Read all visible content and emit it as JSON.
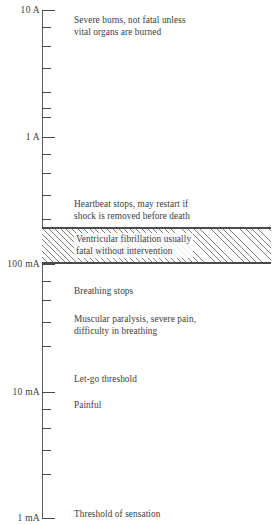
{
  "chart_data": {
    "type": "line",
    "orientation": "vertical-log-axis",
    "xlabel": "",
    "ylabel": "Current",
    "scale": "logarithmic",
    "ylim": [
      "1 mA",
      "10 A"
    ],
    "grid": false,
    "legend": "none",
    "axis_ticks": [
      {
        "label": "10 A",
        "value_amps": 10,
        "y": 10,
        "type": "major"
      },
      {
        "label": "",
        "value_amps": 9,
        "y": 27,
        "type": "minor"
      },
      {
        "label": "",
        "value_amps": 8,
        "y": 46,
        "type": "minor"
      },
      {
        "label": "",
        "value_amps": 7,
        "y": 68,
        "type": "minor"
      },
      {
        "label": "",
        "value_amps": 6,
        "y": 92,
        "type": "minor"
      },
      {
        "label": "",
        "value_amps": 5,
        "y": 108,
        "type": "minor"
      },
      {
        "label": "",
        "value_amps": 4,
        "y": 117,
        "type": "minor"
      },
      {
        "label": "1 A",
        "value_amps": 1,
        "y": 137,
        "type": "major"
      },
      {
        "label": "",
        "value_amps": 0.9,
        "y": 154,
        "type": "minor"
      },
      {
        "label": "",
        "value_amps": 0.8,
        "y": 173,
        "type": "minor"
      },
      {
        "label": "",
        "value_amps": 0.7,
        "y": 195,
        "type": "minor"
      },
      {
        "label": "",
        "value_amps": 0.5,
        "y": 219,
        "type": "minor"
      },
      {
        "label": "100 mA",
        "value_amps": 0.1,
        "y": 264,
        "type": "major"
      },
      {
        "label": "",
        "value_amps": 0.09,
        "y": 281,
        "type": "minor"
      },
      {
        "label": "",
        "value_amps": 0.08,
        "y": 300,
        "type": "minor"
      },
      {
        "label": "",
        "value_amps": 0.07,
        "y": 322,
        "type": "minor"
      },
      {
        "label": "",
        "value_amps": 0.05,
        "y": 346,
        "type": "minor"
      },
      {
        "label": "10 mA",
        "value_amps": 0.01,
        "y": 392,
        "type": "major"
      },
      {
        "label": "",
        "value_amps": 0.009,
        "y": 409,
        "type": "minor"
      },
      {
        "label": "",
        "value_amps": 0.008,
        "y": 428,
        "type": "minor"
      },
      {
        "label": "",
        "value_amps": 0.007,
        "y": 450,
        "type": "minor"
      },
      {
        "label": "",
        "value_amps": 0.005,
        "y": 474,
        "type": "minor"
      },
      {
        "label": "1 mA",
        "value_amps": 0.001,
        "y": 518,
        "type": "major"
      }
    ],
    "annotations": [
      {
        "text": "Severe burns, not fatal unless\nvital organs are burned",
        "y": 14
      },
      {
        "text": "Heartbeat stops, may restart if\nshock is removed before death",
        "y": 198
      },
      {
        "text": "Ventricular fibrillation usually\nfatal without intervention",
        "y": 232,
        "in_band": true
      },
      {
        "text": "Breathing stops",
        "y": 285
      },
      {
        "text": "Muscular paralysis, severe pain,\ndifficulty in breathing",
        "y": 313
      },
      {
        "text": "Let-go threshold",
        "y": 373
      },
      {
        "text": "Painful",
        "y": 399
      },
      {
        "text": "Threshold of sensation",
        "y": 508
      }
    ],
    "band": {
      "label": "Ventricular fibrillation usually\nfatal without intervention",
      "top_y": 227,
      "bottom_y": 264,
      "hatched": true,
      "hatch_color": "#7d7d7d",
      "border_color": "#4a4a4a"
    },
    "colors": {
      "axis": "#5a5a5a",
      "text": "#3d3d3d",
      "background": "#ffffff",
      "hatch": "#7d7d7d"
    }
  },
  "axis": {
    "labels": {
      "top": "10 A",
      "one_amp": "1 A",
      "hundred_ma": "100 mA",
      "ten_ma": "10 mA",
      "one_ma": "1 mA"
    }
  },
  "annotations": {
    "severe_burns": "Severe burns, not fatal unless\nvital organs are burned",
    "heartbeat_stops": "Heartbeat stops, may restart if\nshock is removed before death",
    "ventricular_fibrillation": "Ventricular fibrillation usually\nfatal without intervention",
    "breathing_stops": "Breathing stops",
    "muscular_paralysis": "Muscular paralysis, severe pain,\ndifficulty in breathing",
    "let_go_threshold": "Let-go threshold",
    "painful": "Painful",
    "threshold_of_sensation": "Threshold of sensation"
  }
}
